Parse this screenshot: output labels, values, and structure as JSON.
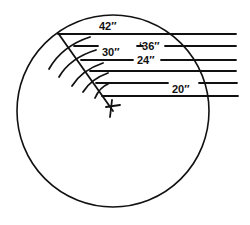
{
  "diagram": {
    "labels": [
      "42″",
      "‘36″",
      "30″",
      "24″",
      "20″"
    ],
    "diameters_in": [
      42,
      36,
      30,
      24,
      20
    ],
    "center_mark": "cross",
    "ink_color": "#111111",
    "background_color": "#ffffff"
  }
}
